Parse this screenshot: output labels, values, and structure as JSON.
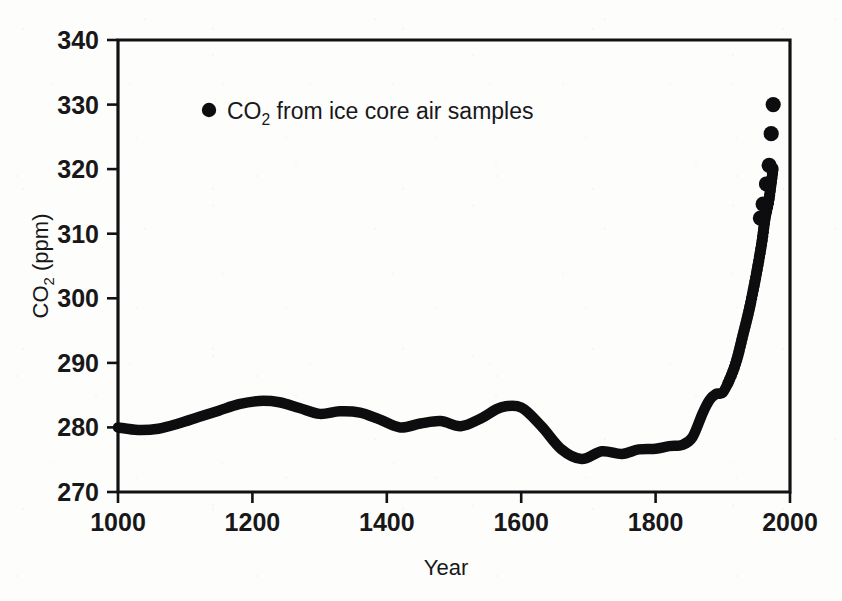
{
  "figure": {
    "background_color": "#fdfdfc",
    "ink_color": "#0d0d0f"
  },
  "chart_data": {
    "type": "line",
    "title": "",
    "subtitle": "",
    "xlabel": "Year",
    "ylabel": "CO2 (ppm)",
    "ylabel_parts": {
      "lead": "CO",
      "sub": "2",
      "tail": " (ppm)"
    },
    "xlim": [
      1000,
      2000
    ],
    "ylim": [
      270,
      340
    ],
    "xticks": [
      1000,
      1200,
      1400,
      1600,
      1800,
      2000
    ],
    "xtick_labels": [
      "1000",
      "1200",
      "1400",
      "1600",
      "1800",
      "2000"
    ],
    "yticks": [
      270,
      280,
      290,
      300,
      310,
      320,
      330,
      340
    ],
    "ytick_labels": [
      "270",
      "280",
      "290",
      "300",
      "310",
      "320",
      "330",
      "340"
    ],
    "grid": false,
    "legend_position": "top-left-inside",
    "legend": [
      {
        "marker": "filled-circle",
        "color": "#0d0d0f",
        "label_lead": "CO",
        "label_sub": "2",
        "label_tail": " from ice core air samples",
        "label": "CO2 from ice core air samples"
      }
    ],
    "series": [
      {
        "name": "CO2 from ice core air samples",
        "marker": "filled-circle",
        "color": "#0d0d0f",
        "x": [
          1000,
          1030,
          1060,
          1090,
          1120,
          1150,
          1180,
          1210,
          1240,
          1270,
          1300,
          1330,
          1360,
          1390,
          1420,
          1450,
          1480,
          1510,
          1540,
          1570,
          1600,
          1630,
          1660,
          1690,
          1720,
          1750,
          1775,
          1800,
          1820,
          1840,
          1855,
          1870,
          1880,
          1890,
          1900,
          1910,
          1920,
          1930,
          1940,
          1950,
          1958,
          1963,
          1968,
          1972,
          1975
        ],
        "y": [
          280.0,
          279.6,
          279.8,
          280.6,
          281.6,
          282.6,
          283.6,
          284.1,
          283.9,
          283.0,
          282.1,
          282.5,
          282.3,
          281.2,
          280.0,
          280.6,
          281.0,
          280.2,
          281.4,
          283.1,
          283.1,
          280.2,
          276.6,
          275.1,
          276.3,
          275.9,
          276.6,
          276.7,
          277.1,
          277.3,
          278.5,
          282.2,
          284.2,
          285.2,
          285.4,
          287.4,
          290.2,
          294.3,
          298.6,
          303.8,
          308.6,
          312.4,
          314.8,
          317.8,
          320.2
        ]
      }
    ],
    "highlight_points": [
      {
        "x": 1975,
        "y": 330.0
      },
      {
        "x": 1972,
        "y": 325.5
      },
      {
        "x": 1969,
        "y": 320.6
      },
      {
        "x": 1965,
        "y": 317.7
      },
      {
        "x": 1960,
        "y": 314.6
      },
      {
        "x": 1956,
        "y": 312.4
      }
    ],
    "annotations": []
  }
}
